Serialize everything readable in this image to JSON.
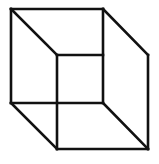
{
  "diagram": {
    "type": "necker-cube",
    "stroke_color": "#111111",
    "background": "#ffffff",
    "stroke_width": 2.6,
    "edges": [
      {
        "name": "front-top",
        "x1": 11,
        "y1": 9,
        "x2": 103,
        "y2": 9
      },
      {
        "name": "front-left",
        "x1": 11,
        "y1": 9,
        "x2": 11,
        "y2": 103
      },
      {
        "name": "front-bottom",
        "x1": 11,
        "y1": 103,
        "x2": 103,
        "y2": 103
      },
      {
        "name": "front-right",
        "x1": 103,
        "y1": 9,
        "x2": 103,
        "y2": 103
      },
      {
        "name": "back-top",
        "x1": 57,
        "y1": 55,
        "x2": 103,
        "y2": 55
      },
      {
        "name": "back-left",
        "x1": 57,
        "y1": 55,
        "x2": 57,
        "y2": 149
      },
      {
        "name": "back-bottom",
        "x1": 57,
        "y1": 149,
        "x2": 148,
        "y2": 149
      },
      {
        "name": "back-right",
        "x1": 148,
        "y1": 55,
        "x2": 148,
        "y2": 149
      },
      {
        "name": "diag-top-left",
        "x1": 11,
        "y1": 9,
        "x2": 57,
        "y2": 55
      },
      {
        "name": "diag-top-right",
        "x1": 103,
        "y1": 9,
        "x2": 148,
        "y2": 55
      },
      {
        "name": "diag-bottom-left",
        "x1": 11,
        "y1": 103,
        "x2": 57,
        "y2": 149
      },
      {
        "name": "diag-bottom-right",
        "x1": 103,
        "y1": 103,
        "x2": 148,
        "y2": 149
      }
    ]
  }
}
